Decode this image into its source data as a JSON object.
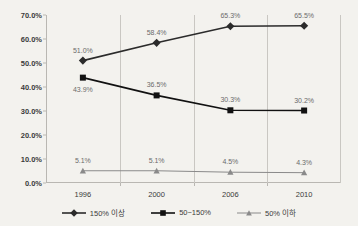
{
  "chart_data": {
    "type": "line",
    "title": "",
    "xlabel": "",
    "ylabel": "",
    "categories": [
      "1996",
      "2000",
      "2006",
      "2010"
    ],
    "ylim": [
      0,
      70
    ],
    "ytick_labels": [
      "0.0%",
      "10.0%",
      "20.0%",
      "30.0%",
      "40.0%",
      "50.0%",
      "60.0%",
      "70.0%"
    ],
    "ytick_values": [
      0,
      10,
      20,
      30,
      40,
      50,
      60,
      70
    ],
    "grid": "vertical",
    "legend_position": "bottom",
    "series": [
      {
        "name": "150% 이상",
        "marker": "diamond",
        "color": "#2b2b2b",
        "values": [
          51.0,
          58.4,
          65.3,
          65.5
        ],
        "labels": [
          "51.0%",
          "58.4%",
          "65.3%",
          "65.5%"
        ],
        "label_offsets": [
          -1,
          -1,
          -1,
          -1
        ]
      },
      {
        "name": "50~150%",
        "marker": "square",
        "color": "#111111",
        "values": [
          43.9,
          36.5,
          30.3,
          30.2
        ],
        "labels": [
          "43.9%",
          "36.5%",
          "30.3%",
          "30.2%"
        ],
        "label_offsets": [
          1,
          -1,
          -1,
          -1
        ]
      },
      {
        "name": "50% 이하",
        "marker": "triangle",
        "color": "#8a8a8a",
        "values": [
          5.1,
          5.1,
          4.5,
          4.3
        ],
        "labels": [
          "5.1%",
          "5.1%",
          "4.5%",
          "4.3%"
        ],
        "label_offsets": [
          -1,
          -1,
          -1,
          -1
        ]
      }
    ]
  },
  "colors": {
    "background": "#f3f2ee",
    "axis": "#b9b7b2",
    "gridline": "#c9c7c2",
    "text": "#3b3b3b",
    "data_label": "#6b6b6b"
  }
}
